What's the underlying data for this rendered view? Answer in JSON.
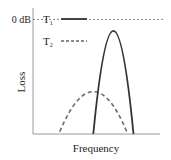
{
  "chart_data": {
    "type": "line",
    "title": "",
    "xlabel": "Frequency",
    "ylabel": "Loss",
    "reference_line": {
      "label": "0 dB",
      "style": "dotted"
    },
    "grid": false,
    "legend": {
      "placement": "top-left",
      "entries": [
        {
          "label": "T",
          "subscript": "1",
          "style": "solid"
        },
        {
          "label": "T",
          "subscript": "2",
          "style": "dashed"
        }
      ]
    },
    "series": [
      {
        "name": "T1",
        "style": "solid",
        "shape": "narrow-peak",
        "x": [
          0.45,
          0.6,
          0.75
        ],
        "y": [
          0.0,
          0.9,
          0.0
        ]
      },
      {
        "name": "T2",
        "style": "dashed",
        "shape": "broad-peak",
        "x": [
          0.2,
          0.45,
          0.7
        ],
        "y": [
          0.02,
          0.37,
          0.02
        ]
      }
    ],
    "xlim": [
      0,
      1
    ],
    "ylim": [
      0,
      1.1
    ],
    "reference_y": 1.0
  },
  "colors": {
    "solid": "#333333",
    "dashed": "#666666",
    "axis": "#999999",
    "reference": "#888888"
  }
}
